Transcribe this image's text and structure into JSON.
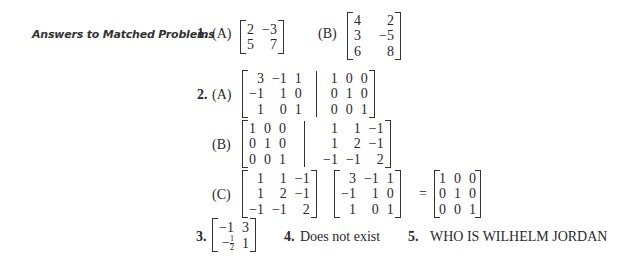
{
  "heading": "Answers to Matched Problems",
  "problems": [
    {
      "number": "1.",
      "parts": [
        {
          "label": "(A)",
          "matrix": [
            [
              "2",
              "−3"
            ],
            [
              "5",
              "7"
            ]
          ]
        },
        {
          "label": "(B)",
          "matrix": [
            [
              "4",
              "2"
            ],
            [
              "3",
              "−5"
            ],
            [
              "6",
              "8"
            ]
          ]
        }
      ]
    },
    {
      "number": "2.",
      "parts": [
        {
          "label": "(A)",
          "left": [
            [
              "3",
              "−1",
              "1"
            ],
            [
              "−1",
              "1",
              "0"
            ],
            [
              "1",
              "0",
              "1"
            ]
          ],
          "right": [
            [
              "1",
              "0",
              "0"
            ],
            [
              "0",
              "1",
              "0"
            ],
            [
              "0",
              "0",
              "1"
            ]
          ]
        },
        {
          "label": "(B)",
          "left": [
            [
              "1",
              "0",
              "0"
            ],
            [
              "0",
              "1",
              "0"
            ],
            [
              "0",
              "0",
              "1"
            ]
          ],
          "right": [
            [
              "1",
              "1",
              "−1"
            ],
            [
              "1",
              "2",
              "−1"
            ],
            [
              "−1",
              "−1",
              "2"
            ]
          ]
        },
        {
          "label": "(C)",
          "m1": [
            [
              "1",
              "1",
              "−1"
            ],
            [
              "1",
              "2",
              "−1"
            ],
            [
              "−1",
              "−1",
              "2"
            ]
          ],
          "m2": [
            [
              "3",
              "−1",
              "1"
            ],
            [
              "−1",
              "1",
              "0"
            ],
            [
              "1",
              "0",
              "1"
            ]
          ],
          "equals": "=",
          "m3": [
            [
              "1",
              "0",
              "0"
            ],
            [
              "0",
              "1",
              "0"
            ],
            [
              "0",
              "0",
              "1"
            ]
          ]
        }
      ]
    },
    {
      "number": "3.",
      "matrix": [
        [
          "−1",
          "3"
        ],
        [
          "−1/2",
          "1"
        ]
      ],
      "frac_num": "1",
      "frac_den": "2",
      "neg": "−"
    },
    {
      "number": "4.",
      "text": "Does not exist"
    },
    {
      "number": "5.",
      "text": "WHO IS WILHELM JORDAN"
    }
  ]
}
